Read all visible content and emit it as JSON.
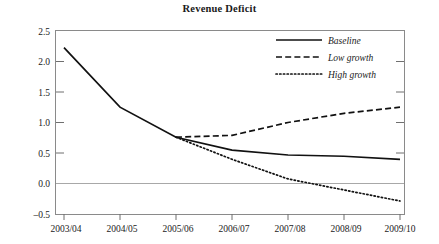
{
  "chart_data": {
    "type": "line",
    "title": "Revenue Deficit",
    "xlabel": "",
    "ylabel": "",
    "categories": [
      "2003/04",
      "2004/05",
      "2005/06",
      "2006/07",
      "2007/08",
      "2008/09",
      "2009/10"
    ],
    "ylim": [
      -0.5,
      2.5
    ],
    "yticks": [
      "-0.5",
      "0.0",
      "0.5",
      "1.0",
      "1.5",
      "2.0",
      "2.5"
    ],
    "ytick_values": [
      -0.5,
      0.0,
      0.5,
      1.0,
      1.5,
      2.0,
      2.5
    ],
    "grid": false,
    "zero_line": true,
    "legend_position": "top-right",
    "series": [
      {
        "name": "Baseline",
        "style": "solid",
        "values": [
          2.22,
          1.25,
          0.76,
          0.55,
          0.47,
          0.45,
          0.4
        ]
      },
      {
        "name": "Low growth",
        "style": "dashed",
        "values": [
          null,
          null,
          0.76,
          0.79,
          1.0,
          1.15,
          1.25
        ]
      },
      {
        "name": "High growth",
        "style": "dotted",
        "values": [
          null,
          null,
          0.76,
          0.4,
          0.08,
          -0.1,
          -0.28
        ]
      }
    ]
  },
  "legend": {
    "items": [
      {
        "label": "Baseline",
        "style": "solid"
      },
      {
        "label": "Low growth",
        "style": "dashed"
      },
      {
        "label": "High growth",
        "style": "dotted"
      }
    ]
  },
  "axes": {
    "y_tick_labels": [
      "2.5",
      "2.0",
      "1.5",
      "1.0",
      "0.5",
      "0.0",
      "–0.5"
    ],
    "x_tick_labels": [
      "2003/04",
      "2004/05",
      "2005/06",
      "2006/07",
      "2007/08",
      "2008/09",
      "2009/10"
    ]
  }
}
